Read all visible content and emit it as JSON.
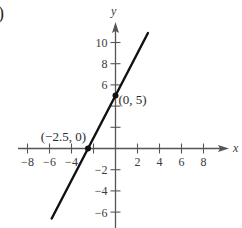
{
  "chart_data": {
    "type": "line",
    "title": "",
    "part_label": ")",
    "xlabel": "x",
    "ylabel": "y",
    "xlim": [
      -8.5,
      10
    ],
    "ylim": [
      -7.5,
      12
    ],
    "x_ticks": [
      -8,
      -6,
      -4,
      -2,
      2,
      4,
      6,
      8
    ],
    "x_tick_labels": [
      "−8",
      "−6",
      "−4",
      "",
      "2",
      "4",
      "6",
      "8"
    ],
    "y_ticks": [
      -6,
      -4,
      -2,
      2,
      4,
      6,
      8,
      10
    ],
    "y_tick_labels": [
      "−6",
      "−4",
      "−2",
      "",
      "",
      "6",
      "8",
      "10"
    ],
    "grid": false,
    "series": [
      {
        "name": "y = 2x + 5",
        "x": [
          -5.8,
          2.95
        ],
        "y": [
          -6.6,
          10.9
        ],
        "color": "#111111"
      }
    ],
    "points": [
      {
        "x": 0,
        "y": 5,
        "label": "(0, 5)"
      },
      {
        "x": -2.5,
        "y": 0,
        "label": "(−2.5, 0)"
      }
    ],
    "axis_color": "#555555"
  }
}
